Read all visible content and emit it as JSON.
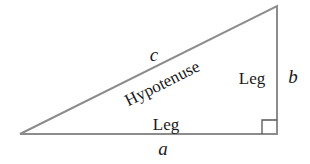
{
  "diagram": {
    "colors": {
      "stroke": "#8c8c8c",
      "text": "#1a1a1a",
      "background": "#ffffff"
    },
    "sides": {
      "hypotenuse": {
        "variable": "c",
        "label": "Hypotenuse"
      },
      "vertical_leg": {
        "variable": "b",
        "label": "Leg"
      },
      "horizontal_leg": {
        "variable": "a",
        "label": "Leg"
      }
    },
    "right_angle_marker": "bottom-right"
  }
}
